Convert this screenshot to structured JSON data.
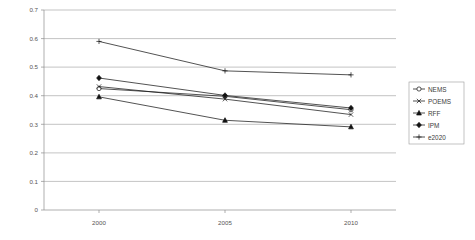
{
  "chart_data": {
    "type": "line",
    "title": "",
    "subtitle": "",
    "xlabel": "",
    "ylabel": "",
    "categories": [
      "2000",
      "2005",
      "2010"
    ],
    "x": [
      2000,
      2005,
      2010
    ],
    "xlim": [
      2000,
      2010
    ],
    "ylim": [
      0,
      0.7
    ],
    "ytick_labels": [
      "0",
      "0.1",
      "0.2",
      "0.3",
      "0.4",
      "0.5",
      "0.6",
      "0.7"
    ],
    "ytick_values": [
      0,
      0.1,
      0.2,
      0.3,
      0.4,
      0.5,
      0.6,
      0.7
    ],
    "xtick_labels": [
      "2000",
      "2005",
      "2010"
    ],
    "grid": "horizontal",
    "legend_position": "right",
    "series": [
      {
        "name": "NEMS",
        "marker": "circle-open",
        "values": [
          0.425,
          0.398,
          0.351
        ]
      },
      {
        "name": "POEMS",
        "marker": "x-cross",
        "values": [
          0.432,
          0.388,
          0.334
        ]
      },
      {
        "name": "RFF",
        "marker": "triangle-solid",
        "values": [
          0.396,
          0.314,
          0.291
        ]
      },
      {
        "name": "IPM",
        "marker": "diamond-solid",
        "values": [
          0.462,
          0.401,
          0.357
        ]
      },
      {
        "name": "e2020",
        "marker": "plus-cross",
        "values": [
          0.59,
          0.487,
          0.473
        ]
      }
    ]
  },
  "legend": {
    "items": [
      {
        "label": "NEMS",
        "icon": "circle-open-marker-icon"
      },
      {
        "label": "POEMS",
        "icon": "x-cross-marker-icon"
      },
      {
        "label": "RFF",
        "icon": "triangle-solid-marker-icon"
      },
      {
        "label": "IPM",
        "icon": "diamond-solid-marker-icon"
      },
      {
        "label": "e2020",
        "icon": "plus-cross-marker-icon"
      }
    ]
  },
  "axes": {
    "y_labels": [
      "0.7",
      "0.6",
      "0.5",
      "0.4",
      "0.3",
      "0.2",
      "0.1",
      "0"
    ],
    "x_labels": [
      "2000",
      "2005",
      "2010"
    ]
  },
  "colors": {
    "line": "#1a1a1a",
    "grid": "#9a9a9a",
    "axis": "#8c8c8c",
    "text": "#555555",
    "background": "#ffffff"
  }
}
